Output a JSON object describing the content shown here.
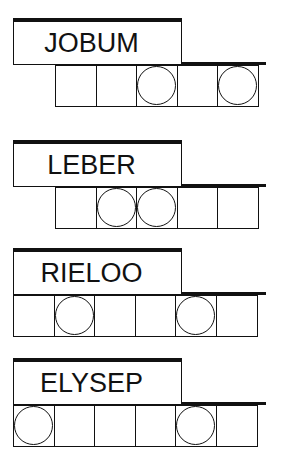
{
  "puzzles": [
    {
      "scrambled": "JOBUM",
      "slots": 5,
      "circled": [
        3,
        5
      ]
    },
    {
      "scrambled": "LEBER",
      "slots": 5,
      "circled": [
        2,
        3
      ]
    },
    {
      "scrambled": "RIELOO",
      "slots": 6,
      "circled": [
        2,
        5
      ]
    },
    {
      "scrambled": "ELYSEP",
      "slots": 6,
      "circled": [
        1,
        5
      ]
    }
  ],
  "colors": {
    "ink": "#111111",
    "background": "#ffffff"
  }
}
